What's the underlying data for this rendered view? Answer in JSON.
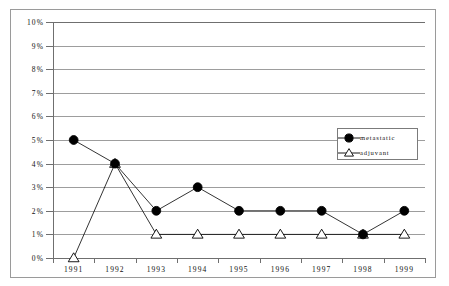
{
  "chart_data": {
    "type": "line",
    "title": "",
    "subtitle": "",
    "xlabel": "",
    "ylabel": "",
    "categories": [
      "1991",
      "1992",
      "1993",
      "1994",
      "1995",
      "1996",
      "1997",
      "1998",
      "1999"
    ],
    "series": [
      {
        "name": "metastatic",
        "marker": "filled-circle",
        "values": [
          5,
          4,
          2,
          3,
          2,
          2,
          2,
          1,
          2
        ]
      },
      {
        "name": "adjuvant",
        "marker": "open-triangle",
        "values": [
          0,
          4,
          1,
          1,
          1,
          1,
          1,
          1,
          1
        ]
      }
    ],
    "ylim": [
      0,
      10
    ],
    "ytick_values": [
      0,
      1,
      2,
      3,
      4,
      5,
      6,
      7,
      8,
      9,
      10
    ],
    "ytick_labels": [
      "0%",
      "1%",
      "2%",
      "3%",
      "4%",
      "5%",
      "6%",
      "7%",
      "8%",
      "9%",
      "10%"
    ],
    "grid": "horizontal",
    "legend_position": "inside-upper-right",
    "colors": {
      "line": "#000000",
      "marker_fill_metastatic": "#000000",
      "marker_fill_adjuvant": "#ffffff",
      "marker_stroke": "#000000",
      "gridline": "#9d9d9d",
      "axis": "#6f6f6f",
      "frame": "#9a9a9a",
      "background": "#ffffff"
    }
  },
  "legend": {
    "entries": [
      {
        "label": "metastatic"
      },
      {
        "label": "adjuvant"
      }
    ]
  }
}
